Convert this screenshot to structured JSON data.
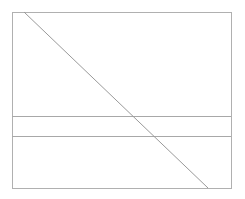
{
  "canvas": {
    "width": 245,
    "height": 199,
    "background_color": "#ffffff",
    "title": "Line Diagram"
  },
  "style": {
    "border_color": "#b0b0b0",
    "horizontal_rule_color": "#a8a8a8",
    "diagonal_color": "#9a9a9a",
    "border_width": 1,
    "horizontal_rule_width": 1,
    "diagonal_width": 1
  },
  "shapes": {
    "outer_rectangle": {
      "name": "outer-rectangle",
      "x": 12,
      "y": 12,
      "width": 219,
      "height": 176,
      "right": 231,
      "bottom": 188,
      "stroke": "#b0b0b0",
      "fill": "none"
    },
    "horizontal_lines": [
      {
        "name": "upper-horizontal-line",
        "x1": 12,
        "y1": 116,
        "x2": 231,
        "y2": 116,
        "stroke": "#a8a8a8"
      },
      {
        "name": "lower-horizontal-line",
        "x1": 12,
        "y1": 136,
        "x2": 231,
        "y2": 136,
        "stroke": "#a8a8a8"
      }
    ],
    "diagonal_line": {
      "name": "diagonal-line",
      "x1": 24,
      "y1": 12,
      "x2": 208,
      "y2": 188,
      "stroke": "#9a9a9a"
    }
  },
  "regions": [
    {
      "name": "top-region",
      "top": 12,
      "bottom": 116
    },
    {
      "name": "middle-band",
      "top": 116,
      "bottom": 136
    },
    {
      "name": "bottom-region",
      "top": 136,
      "bottom": 188
    }
  ]
}
